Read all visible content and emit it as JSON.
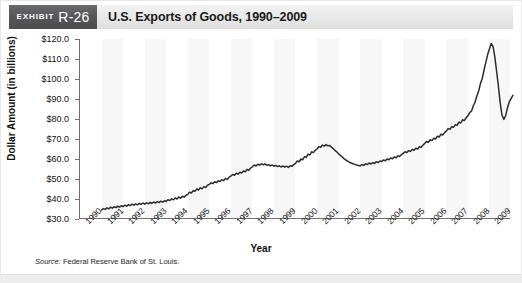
{
  "header": {
    "exhibit_word": "EXHIBIT",
    "exhibit_number": "R-26",
    "title": "U.S. Exports of Goods, 1990–2009",
    "badge_color": "#58585a",
    "title_bar_color": "#e9e9e9"
  },
  "source_note": {
    "label": "Source:",
    "text": " Federal Reserve Bank of St. Louis."
  },
  "chart_data": {
    "type": "line",
    "title": "U.S. Exports of Goods, 1990–2009",
    "xlabel": "Year",
    "ylabel": "Dollar Amount (in billions)",
    "ylim": [
      30.0,
      120.0
    ],
    "ytick_labels": [
      "$120.0",
      "$110.0",
      "$100.0",
      "$90.0",
      "$80.0",
      "$70.0",
      "$60.0",
      "$50.0",
      "$40.0",
      "$30.0"
    ],
    "ytick_values": [
      120.0,
      110.0,
      100.0,
      90.0,
      80.0,
      70.0,
      60.0,
      50.0,
      40.0,
      30.0
    ],
    "xtick_labels": [
      "1990",
      "1991",
      "1992",
      "1993",
      "1994",
      "1995",
      "1996",
      "1997",
      "1998",
      "1999",
      "2000",
      "2001",
      "2002",
      "2003",
      "2004",
      "2005",
      "2006",
      "2007",
      "2008",
      "2009"
    ],
    "xlim": [
      1990,
      2010
    ],
    "grid": false,
    "legend": null,
    "line_color": "#2b2b2b",
    "series_name": "U.S. Exports of Goods",
    "annotations": [],
    "x": [
      1991.0,
      1991.08,
      1991.17,
      1991.25,
      1991.33,
      1991.42,
      1991.5,
      1991.58,
      1991.67,
      1991.75,
      1991.83,
      1991.92,
      1992.0,
      1992.08,
      1992.17,
      1992.25,
      1992.33,
      1992.42,
      1992.5,
      1992.58,
      1992.67,
      1992.75,
      1992.83,
      1992.92,
      1993.0,
      1993.08,
      1993.17,
      1993.25,
      1993.33,
      1993.42,
      1993.5,
      1993.58,
      1993.67,
      1993.75,
      1993.83,
      1993.92,
      1994.0,
      1994.08,
      1994.17,
      1994.25,
      1994.33,
      1994.42,
      1994.5,
      1994.58,
      1994.67,
      1994.75,
      1994.83,
      1994.92,
      1995.0,
      1995.08,
      1995.17,
      1995.25,
      1995.33,
      1995.42,
      1995.5,
      1995.58,
      1995.67,
      1995.75,
      1995.83,
      1995.92,
      1996.0,
      1996.08,
      1996.17,
      1996.25,
      1996.33,
      1996.42,
      1996.5,
      1996.58,
      1996.67,
      1996.75,
      1996.83,
      1996.92,
      1997.0,
      1997.08,
      1997.17,
      1997.25,
      1997.33,
      1997.42,
      1997.5,
      1997.58,
      1997.67,
      1997.75,
      1997.83,
      1997.92,
      1998.0,
      1998.08,
      1998.17,
      1998.25,
      1998.33,
      1998.42,
      1998.5,
      1998.58,
      1998.67,
      1998.75,
      1998.83,
      1998.92,
      1999.0,
      1999.08,
      1999.17,
      1999.25,
      1999.33,
      1999.42,
      1999.5,
      1999.58,
      1999.67,
      1999.75,
      1999.83,
      1999.92,
      2000.0,
      2000.08,
      2000.17,
      2000.25,
      2000.33,
      2000.42,
      2000.5,
      2000.58,
      2000.67,
      2000.75,
      2000.83,
      2000.92,
      2001.0,
      2001.08,
      2001.17,
      2001.25,
      2001.33,
      2001.42,
      2001.5,
      2001.58,
      2001.67,
      2001.75,
      2001.83,
      2001.92,
      2002.0,
      2002.08,
      2002.17,
      2002.25,
      2002.33,
      2002.42,
      2002.5,
      2002.58,
      2002.67,
      2002.75,
      2002.83,
      2002.92,
      2003.0,
      2003.08,
      2003.17,
      2003.25,
      2003.33,
      2003.42,
      2003.5,
      2003.58,
      2003.67,
      2003.75,
      2003.83,
      2003.92,
      2004.0,
      2004.08,
      2004.17,
      2004.25,
      2004.33,
      2004.42,
      2004.5,
      2004.58,
      2004.67,
      2004.75,
      2004.83,
      2004.92,
      2005.0,
      2005.08,
      2005.17,
      2005.25,
      2005.33,
      2005.42,
      2005.5,
      2005.58,
      2005.67,
      2005.75,
      2005.83,
      2005.92,
      2006.0,
      2006.08,
      2006.17,
      2006.25,
      2006.33,
      2006.42,
      2006.5,
      2006.58,
      2006.67,
      2006.75,
      2006.83,
      2006.92,
      2007.0,
      2007.08,
      2007.17,
      2007.25,
      2007.33,
      2007.42,
      2007.5,
      2007.58,
      2007.67,
      2007.75,
      2007.83,
      2007.92,
      2008.0,
      2008.08,
      2008.17,
      2008.25,
      2008.33,
      2008.42,
      2008.5,
      2008.58,
      2008.67,
      2008.75,
      2008.83,
      2008.92,
      2009.0,
      2009.08,
      2009.17,
      2009.25,
      2009.33,
      2009.42,
      2009.5,
      2009.58,
      2009.67,
      2009.75,
      2009.83,
      2009.92
    ],
    "values": [
      34.5,
      35.2,
      34.8,
      35.6,
      35.1,
      35.9,
      35.4,
      36.1,
      35.7,
      36.4,
      36.0,
      36.6,
      36.2,
      36.9,
      36.4,
      37.2,
      36.7,
      37.4,
      36.9,
      37.6,
      37.1,
      37.8,
      37.3,
      38.0,
      37.4,
      38.1,
      37.6,
      38.3,
      37.8,
      38.5,
      38.0,
      38.7,
      38.2,
      38.9,
      38.4,
      39.1,
      38.8,
      39.6,
      39.2,
      40.1,
      39.6,
      40.5,
      40.0,
      41.0,
      40.4,
      41.4,
      40.9,
      41.9,
      42.3,
      43.4,
      43.0,
      44.2,
      43.8,
      45.0,
      44.5,
      45.6,
      45.1,
      46.2,
      45.8,
      46.9,
      47.3,
      48.1,
      47.7,
      48.6,
      48.2,
      49.1,
      48.7,
      49.6,
      49.2,
      50.3,
      49.8,
      50.9,
      51.4,
      52.3,
      51.9,
      52.9,
      52.4,
      53.4,
      53.0,
      54.0,
      53.6,
      54.8,
      54.3,
      55.5,
      56.1,
      57.0,
      56.5,
      57.4,
      57.0,
      57.6,
      57.1,
      57.5,
      56.9,
      57.2,
      56.6,
      57.0,
      56.4,
      56.8,
      56.2,
      56.6,
      56.0,
      56.5,
      55.9,
      56.4,
      55.8,
      56.6,
      56.3,
      57.2,
      57.8,
      59.0,
      58.6,
      60.0,
      59.6,
      61.2,
      60.8,
      62.4,
      62.0,
      63.6,
      63.2,
      64.4,
      65.0,
      66.2,
      65.8,
      67.0,
      66.4,
      67.2,
      66.6,
      66.8,
      65.9,
      65.2,
      64.3,
      63.5,
      62.6,
      61.8,
      61.0,
      60.2,
      59.5,
      58.9,
      58.4,
      58.0,
      57.6,
      57.3,
      57.0,
      56.8,
      56.5,
      57.2,
      56.8,
      57.6,
      57.2,
      58.0,
      57.5,
      58.2,
      57.8,
      58.6,
      58.2,
      59.0,
      58.7,
      59.5,
      59.1,
      60.0,
      59.6,
      60.5,
      60.1,
      61.0,
      60.6,
      61.6,
      61.2,
      62.2,
      62.8,
      63.6,
      63.2,
      64.2,
      63.8,
      64.8,
      64.4,
      65.4,
      65.0,
      66.2,
      65.8,
      67.0,
      67.8,
      68.8,
      68.4,
      69.6,
      69.2,
      70.4,
      70.0,
      71.4,
      71.0,
      72.4,
      72.0,
      73.2,
      74.0,
      75.2,
      74.8,
      76.2,
      75.8,
      77.2,
      76.8,
      78.4,
      78.0,
      79.6,
      79.2,
      80.6,
      81.6,
      83.2,
      84.0,
      86.6,
      88.4,
      91.6,
      94.0,
      97.6,
      100.4,
      104.6,
      108.2,
      112.4,
      115.0,
      117.8,
      116.2,
      111.0,
      104.0,
      96.0,
      88.0,
      82.0,
      79.8,
      81.6,
      85.4,
      88.6
    ],
    "last_values_tail": [
      90.2,
      91.8,
      92.4
    ]
  }
}
